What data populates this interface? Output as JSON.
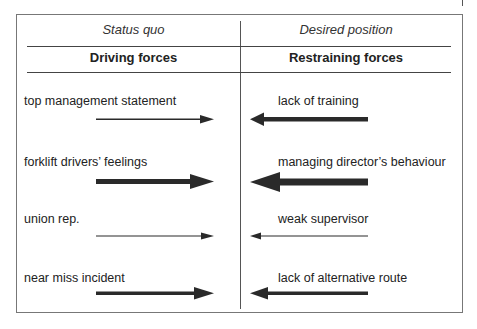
{
  "diagram": {
    "type": "force-field-analysis",
    "header": {
      "left_state": "Status quo",
      "right_state": "Desired position",
      "left_title": "Driving forces",
      "right_title": "Restraining forces"
    },
    "driving_forces": [
      {
        "label": "top management statement",
        "strength": "weak"
      },
      {
        "label": "forklift drivers’ feelings",
        "strength": "strong"
      },
      {
        "label": "union rep.",
        "strength": "very weak"
      },
      {
        "label": "near miss incident",
        "strength": "medium"
      }
    ],
    "restraining_forces": [
      {
        "label": "lack of training",
        "strength": "medium"
      },
      {
        "label": "managing director’s behaviour",
        "strength": "strong"
      },
      {
        "label": "weak supervisor",
        "strength": "very weak"
      },
      {
        "label": "lack of alternative route",
        "strength": "medium"
      }
    ],
    "colors": {
      "arrow": "#2a2a2a",
      "line": "#444444"
    }
  }
}
